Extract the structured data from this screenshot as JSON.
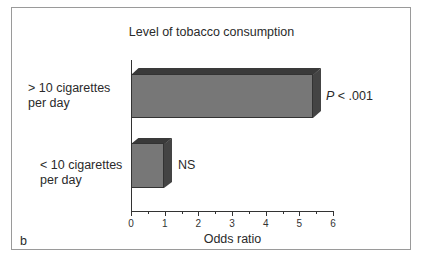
{
  "chart_data": {
    "type": "bar",
    "orientation": "horizontal",
    "style": "3d",
    "title": "Level of tobacco consumption",
    "categories": [
      "> 10 cigarettes per day",
      "< 10 cigarettes per day"
    ],
    "category_lines": [
      [
        "> 10 cigarettes",
        "per day"
      ],
      [
        "< 10 cigarettes",
        "per day"
      ]
    ],
    "values": [
      5.4,
      1.0
    ],
    "annotations": [
      {
        "prefix": "P",
        "text": " < .001"
      },
      {
        "prefix": "",
        "text": "NS"
      }
    ],
    "xlabel": "Odds ratio",
    "ylabel": "",
    "xlim": [
      0,
      6
    ],
    "xticks": [
      "0",
      "1",
      "2",
      "3",
      "4",
      "5",
      "6"
    ],
    "grid": false,
    "legend": null,
    "panel_label": "b",
    "bar_color": "#777777"
  }
}
